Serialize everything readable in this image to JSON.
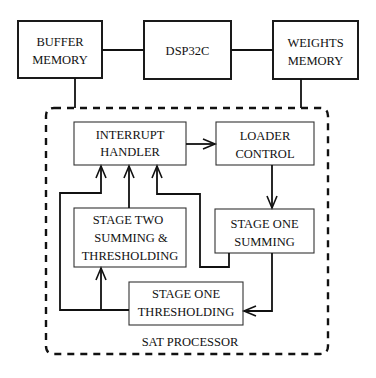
{
  "diagram": {
    "top_blocks": {
      "buffer_memory": {
        "line1": "BUFFER",
        "line2": "MEMORY"
      },
      "dsp": {
        "label": "DSP32C"
      },
      "weights_memory": {
        "line1": "WEIGHTS",
        "line2": "MEMORY"
      }
    },
    "processor": {
      "label": "SAT PROCESSOR",
      "interrupt_handler": {
        "line1": "INTERRUPT",
        "line2": "HANDLER"
      },
      "loader_control": {
        "line1": "LOADER",
        "line2": "CONTROL"
      },
      "stage_two": {
        "line1": "STAGE TWO",
        "line2": "SUMMING &",
        "line3": "THRESHOLDING"
      },
      "stage_one_summing": {
        "line1": "STAGE ONE",
        "line2": "SUMMING"
      },
      "stage_one_thresholding": {
        "line1": "STAGE ONE",
        "line2": "THRESHOLDING"
      }
    },
    "connections": [
      {
        "from": "BUFFER MEMORY",
        "to": "DSP32C",
        "type": "line"
      },
      {
        "from": "DSP32C",
        "to": "WEIGHTS MEMORY",
        "type": "line"
      },
      {
        "from": "BUFFER MEMORY",
        "to": "SAT PROCESSOR",
        "type": "line"
      },
      {
        "from": "WEIGHTS MEMORY",
        "to": "SAT PROCESSOR",
        "type": "line"
      },
      {
        "from": "INTERRUPT HANDLER",
        "to": "LOADER CONTROL",
        "type": "arrow"
      },
      {
        "from": "LOADER CONTROL",
        "to": "STAGE ONE SUMMING",
        "type": "arrow"
      },
      {
        "from": "STAGE ONE SUMMING",
        "to": "STAGE ONE THRESHOLDING",
        "type": "arrow"
      },
      {
        "from": "STAGE ONE THRESHOLDING",
        "to": "STAGE TWO SUMMING & THRESHOLDING",
        "type": "arrow"
      },
      {
        "from": "STAGE ONE THRESHOLDING",
        "to": "INTERRUPT HANDLER",
        "type": "arrow"
      },
      {
        "from": "STAGE TWO SUMMING & THRESHOLDING",
        "to": "INTERRUPT HANDLER",
        "type": "arrow"
      },
      {
        "from": "STAGE ONE SUMMING",
        "to": "INTERRUPT HANDLER",
        "type": "arrow"
      }
    ]
  }
}
